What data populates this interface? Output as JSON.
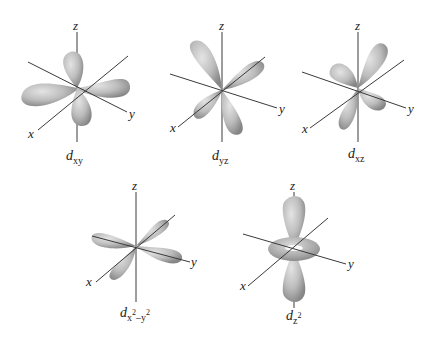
{
  "figure": {
    "orbitals": [
      {
        "id": "dxy",
        "symbol": "d",
        "subscript": "xy",
        "superscript": "",
        "axes": {
          "x": "x",
          "y": "y",
          "z": "z"
        }
      },
      {
        "id": "dyz",
        "symbol": "d",
        "subscript": "yz",
        "superscript": "",
        "axes": {
          "x": "x",
          "y": "y",
          "z": "z"
        }
      },
      {
        "id": "dxz",
        "symbol": "d",
        "subscript": "xz",
        "superscript": "",
        "axes": {
          "x": "x",
          "y": "y",
          "z": "z"
        }
      },
      {
        "id": "dx2y2",
        "symbol": "d",
        "subscript_parts": [
          "x",
          "2",
          "–y",
          "2"
        ],
        "axes": {
          "x": "x",
          "y": "y",
          "z": "z"
        }
      },
      {
        "id": "dz2",
        "symbol": "d",
        "subscript_parts": [
          "z",
          "2"
        ],
        "axes": {
          "x": "x",
          "y": "y",
          "z": "z"
        }
      }
    ]
  },
  "colors": {
    "lobe_light": "#d6d6d6",
    "lobe_dark": "#8c8c8c",
    "axis": "#3a3a3a",
    "background": "#ffffff"
  }
}
